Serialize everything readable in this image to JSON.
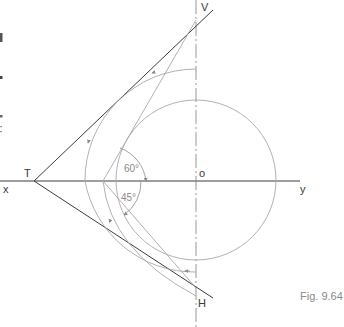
{
  "figure": {
    "caption": "Fig. 9.64",
    "labels": {
      "x": "x",
      "y": "y",
      "T": "T",
      "V": "V",
      "H": "H",
      "o": "o"
    },
    "angles": {
      "upper": "60°",
      "lower": "45°"
    }
  },
  "colors": {
    "dark_line": "#3c3c3c",
    "light_line": "#a8a8a8",
    "text": "#3a3a3a",
    "caption": "#8a8a8a"
  }
}
